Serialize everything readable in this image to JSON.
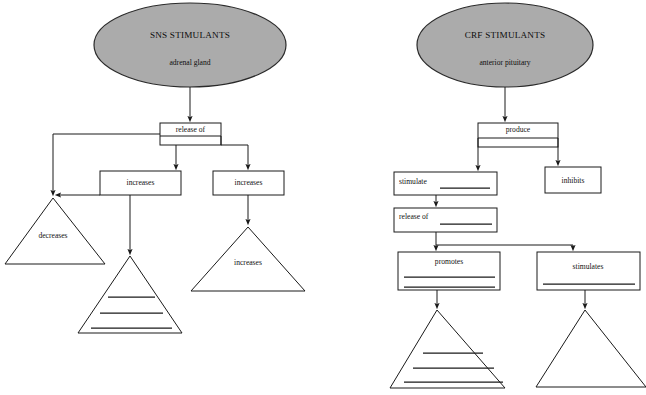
{
  "page": {
    "background_color": "#ffffff",
    "ink_color": "#1a1a1a",
    "oval_fill_color": "#ababab",
    "width": 646,
    "height": 395
  },
  "left_branch": {
    "root": {
      "title": "SNS STIMULANTS",
      "subtitle": "adrenal gland"
    },
    "box_release_of": {
      "label": "release of"
    },
    "box_increases_mid": {
      "label": "increases"
    },
    "box_increases_right": {
      "label": "increases"
    },
    "triangle_decreases": {
      "label": "decreases",
      "blank_lines": 0
    },
    "triangle_blank_mid": {
      "label": "",
      "blank_lines": 3
    },
    "triangle_increases": {
      "label": "increases",
      "blank_lines": 0
    }
  },
  "right_branch": {
    "root": {
      "title": "CRF STIMULANTS",
      "subtitle": "anterior pituitary"
    },
    "box_produce": {
      "label": "produce"
    },
    "box_inhibits": {
      "label": "inhibits"
    },
    "box_stimulate": {
      "label": "stimulate",
      "blank_lines": 1
    },
    "box_release_of": {
      "label": "release of",
      "blank_lines": 1
    },
    "box_promotes": {
      "label": "promotes",
      "blank_lines": 2
    },
    "box_stimulates": {
      "label": "stimulates",
      "blank_lines": 1
    },
    "triangle_blank_left": {
      "label": "",
      "blank_lines": 3
    },
    "triangle_blank_right": {
      "label": "",
      "blank_lines": 0
    }
  }
}
